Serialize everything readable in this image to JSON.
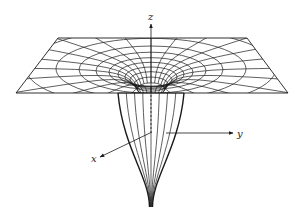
{
  "diagram": {
    "line_color": "#1a1a1a",
    "background": "#ffffff",
    "axes": {
      "z": {
        "label": "z"
      },
      "y": {
        "label": "y"
      },
      "x": {
        "label": "x"
      }
    },
    "plane": {
      "corners": [
        [
          58,
          38
        ],
        [
          247,
          38
        ],
        [
          288,
          93
        ],
        [
          16,
          93
        ]
      ]
    },
    "well": {
      "center": [
        151,
        73
      ],
      "ring_radii": [
        14,
        17,
        21,
        26,
        33,
        42,
        55,
        72,
        95,
        125,
        165
      ],
      "ring_aspect": 0.3,
      "radial_count": 24,
      "throat_half_width": 33,
      "throat_y": 93,
      "tip": [
        151,
        207
      ],
      "funnel_lines": 9
    }
  }
}
